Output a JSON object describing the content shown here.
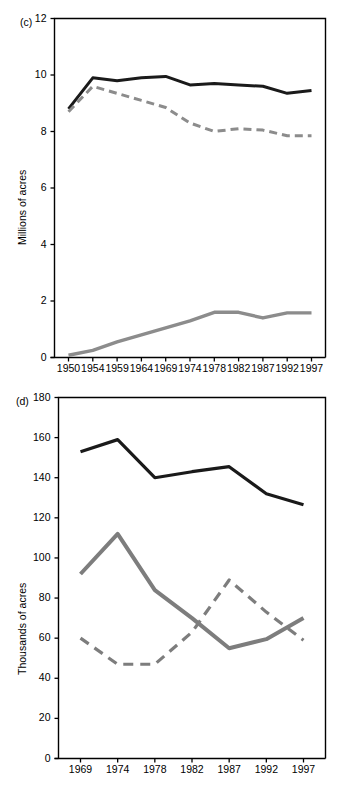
{
  "figure": {
    "panels": [
      {
        "tag": "(c)",
        "ylabel": "Millions of acres",
        "chart_index": 0
      },
      {
        "tag": "(d)",
        "ylabel": "Thousands of acres",
        "chart_index": 1
      }
    ]
  },
  "chart_data": [
    {
      "type": "line",
      "title": "",
      "panel_label": "(c)",
      "xlabel": "",
      "ylabel": "Millions of acres",
      "categories": [
        "1950",
        "1954",
        "1959",
        "1964",
        "1969",
        "1974",
        "1978",
        "1982",
        "1987",
        "1992",
        "1997"
      ],
      "x": [
        1950,
        1954,
        1959,
        1964,
        1969,
        1974,
        1978,
        1982,
        1987,
        1992,
        1997
      ],
      "ylim": [
        0,
        12
      ],
      "yticks": [
        0,
        2,
        4,
        6,
        8,
        10,
        12
      ],
      "ytick_labels": [
        "0",
        "2",
        "4",
        "6",
        "8",
        "10",
        "12"
      ],
      "grid": false,
      "legend": "none",
      "series": [
        {
          "name": "total",
          "style": "solid",
          "color": "#1a1a1a",
          "width": 3.0,
          "values": [
            8.8,
            9.9,
            9.8,
            9.9,
            9.95,
            9.65,
            9.7,
            9.65,
            9.6,
            9.35,
            9.45
          ]
        },
        {
          "name": "dashed-grey",
          "style": "dashed",
          "color": "#8c8c8c",
          "width": 3.0,
          "values": [
            8.7,
            9.6,
            9.35,
            9.1,
            8.85,
            8.3,
            8.0,
            8.1,
            8.05,
            7.85,
            7.85
          ]
        },
        {
          "name": "solid-grey",
          "style": "solid",
          "color": "#8c8c8c",
          "width": 3.4,
          "values": [
            0.08,
            0.25,
            0.55,
            0.8,
            1.05,
            1.3,
            1.6,
            1.6,
            1.4,
            1.58,
            1.58
          ]
        }
      ]
    },
    {
      "type": "line",
      "title": "",
      "panel_label": "(d)",
      "xlabel": "",
      "ylabel": "Thousands of acres",
      "categories": [
        "1969",
        "1974",
        "1978",
        "1982",
        "1987",
        "1992",
        "1997"
      ],
      "x": [
        1969,
        1974,
        1978,
        1982,
        1987,
        1992,
        1997
      ],
      "ylim": [
        0,
        180
      ],
      "yticks": [
        0,
        20,
        40,
        60,
        80,
        100,
        120,
        140,
        160,
        180
      ],
      "ytick_labels": [
        "0",
        "20",
        "40",
        "60",
        "80",
        "100",
        "120",
        "140",
        "160",
        "180"
      ],
      "grid": false,
      "legend": "none",
      "series": [
        {
          "name": "total",
          "style": "solid",
          "color": "#1a1a1a",
          "width": 3.2,
          "values": [
            153,
            159,
            140,
            143,
            145.5,
            132,
            126.5
          ]
        },
        {
          "name": "solid-grey",
          "style": "solid",
          "color": "#7d7d7d",
          "width": 4.0,
          "values": [
            92,
            112,
            84,
            70,
            55,
            59.5,
            70
          ]
        },
        {
          "name": "dashed-grey",
          "style": "dashed",
          "color": "#7d7d7d",
          "width": 3.2,
          "values": [
            60,
            47,
            47,
            63,
            89,
            73,
            59
          ]
        }
      ]
    }
  ]
}
